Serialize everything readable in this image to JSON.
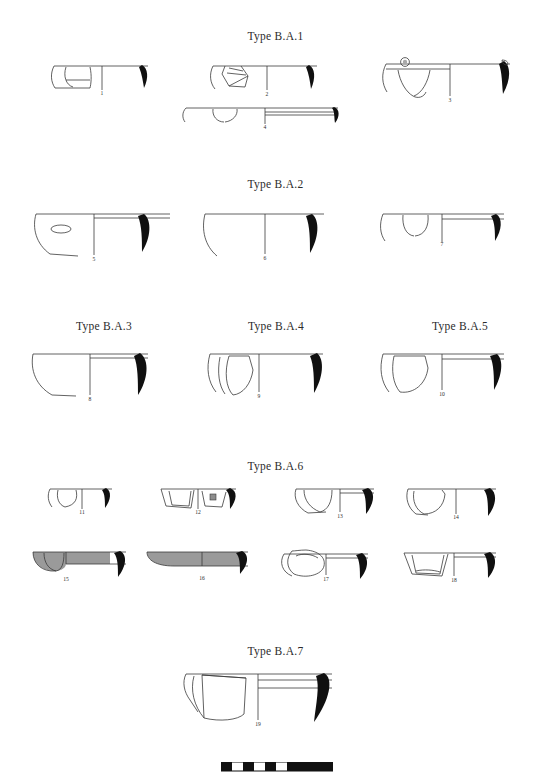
{
  "plate": {
    "title_prefix": "Type",
    "background_color": "#ffffff",
    "ink_color": "#1a1a1a",
    "gray_fill_color": "#9a9a9a",
    "section_headings": [
      {
        "id": "heading-ba1",
        "label": "Type B.A.1"
      },
      {
        "id": "heading-ba2",
        "label": "Type B.A.2"
      },
      {
        "id": "heading-ba3",
        "label": "Type B.A.3"
      },
      {
        "id": "heading-ba4",
        "label": "Type B.A.4"
      },
      {
        "id": "heading-ba5",
        "label": "Type B.A.5"
      },
      {
        "id": "heading-ba6",
        "label": "Type B.A.6"
      },
      {
        "id": "heading-ba7",
        "label": "Type B.A.7"
      }
    ],
    "figures": [
      {
        "number": "1",
        "type": "B.A.1",
        "fill": "none",
        "note": "shallow bowl rim profile"
      },
      {
        "number": "2",
        "type": "B.A.1",
        "fill": "none",
        "note": "bowl with angular panel decoration"
      },
      {
        "number": "3",
        "type": "B.A.1",
        "fill": "none",
        "note": "wide bowl with rim lug and V motif"
      },
      {
        "number": "4",
        "type": "B.A.1",
        "fill": "none",
        "note": "shallow wide dish, banded rim"
      },
      {
        "number": "5",
        "type": "B.A.2",
        "fill": "none",
        "note": "deep bowl with small oval motif"
      },
      {
        "number": "6",
        "type": "B.A.2",
        "fill": "none",
        "note": "plain deep bowl"
      },
      {
        "number": "7",
        "type": "B.A.2",
        "fill": "none",
        "note": "bowl with rectangular panel"
      },
      {
        "number": "8",
        "type": "B.A.3",
        "fill": "none",
        "note": "deep bowl, plain body"
      },
      {
        "number": "9",
        "type": "B.A.4",
        "fill": "none",
        "note": "bowl with large irregular panel"
      },
      {
        "number": "10",
        "type": "B.A.5",
        "fill": "none",
        "note": "bowl with rounded panel"
      },
      {
        "number": "11",
        "type": "B.A.6",
        "fill": "none",
        "note": "small shallow bowl"
      },
      {
        "number": "12",
        "type": "B.A.6",
        "fill": "none",
        "note": "small bowl with stamped square motif"
      },
      {
        "number": "13",
        "type": "B.A.6",
        "fill": "none",
        "note": "small bowl, angular panel"
      },
      {
        "number": "14",
        "type": "B.A.6",
        "fill": "none",
        "note": "small bowl, rounded panel"
      },
      {
        "number": "15",
        "type": "B.A.6",
        "fill": "gray",
        "note": "shallow bowl with grey slipped surface"
      },
      {
        "number": "16",
        "type": "B.A.6",
        "fill": "gray",
        "note": "shallow dish, fully grey slipped"
      },
      {
        "number": "17",
        "type": "B.A.6",
        "fill": "none",
        "note": "bowl with rounded blob panel"
      },
      {
        "number": "18",
        "type": "B.A.6",
        "fill": "none",
        "note": "bowl with trapezoid panel"
      },
      {
        "number": "19",
        "type": "B.A.7",
        "fill": "none",
        "note": "large deep vessel, thick rim profile"
      }
    ],
    "scale_bar": {
      "name": "scale-bar",
      "segments": 6
    }
  }
}
